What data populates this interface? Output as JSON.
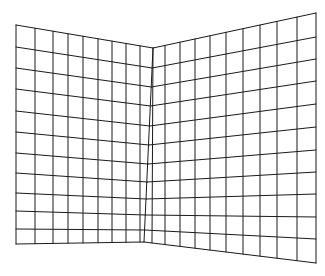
{
  "figure": {
    "stroke_color": "#1a1a1a",
    "background_color": "#ffffff"
  },
  "left_panel": {
    "corners": {
      "top_left": [
        16,
        25
      ],
      "top_right": [
        153,
        48
      ],
      "bottom_right": [
        144,
        242
      ],
      "bottom_left": [
        16,
        244
      ]
    },
    "columns": 9,
    "rows": 11,
    "left_edge_ys": [
      25,
      47,
      68,
      89,
      111,
      132,
      153,
      173,
      193,
      211,
      229,
      244
    ],
    "fold_edge_ys": [
      48,
      68,
      87,
      106,
      126,
      145,
      164,
      182,
      199,
      215,
      230,
      242
    ],
    "top_edge_xs": [
      16,
      35,
      53,
      68,
      83,
      98,
      112,
      126,
      140,
      153
    ],
    "bottom_edge_xs": [
      16,
      35,
      53,
      68,
      83,
      98,
      112,
      126,
      140,
      144
    ]
  },
  "right_panel": {
    "corners": {
      "top_left": [
        153,
        48
      ],
      "top_right": [
        316,
        13
      ],
      "bottom_right": [
        316,
        263
      ],
      "bottom_left": [
        144,
        242
      ]
    },
    "columns": 10,
    "rows": 11,
    "fold_edge_ys": [
      48,
      68,
      87,
      106,
      126,
      145,
      164,
      182,
      199,
      215,
      230,
      242
    ],
    "right_edge_ys": [
      13,
      37,
      59,
      81,
      104,
      127,
      150,
      172,
      194,
      217,
      239,
      263
    ],
    "top_edge_xs": [
      153,
      165,
      180,
      195,
      210,
      226,
      243,
      260,
      277,
      297,
      316
    ],
    "bottom_edge_xs": [
      144,
      165,
      180,
      195,
      210,
      226,
      243,
      260,
      277,
      297,
      316
    ]
  }
}
